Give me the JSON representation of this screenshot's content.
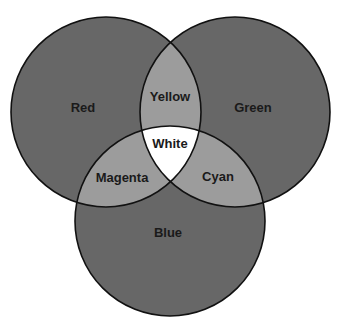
{
  "diagram": {
    "type": "venn",
    "title": "",
    "colors": {
      "primary_fill": "#676767",
      "overlap_fill": "#9c9c9c",
      "center_fill": "#ffffff",
      "stroke": "#111111",
      "background": "#ffffff"
    },
    "circles": [
      {
        "name": "red",
        "label": "Red",
        "cx": 106,
        "cy": 112,
        "r": 95
      },
      {
        "name": "green",
        "label": "Green",
        "cx": 235,
        "cy": 112,
        "r": 95
      },
      {
        "name": "blue",
        "label": "Blue",
        "cx": 170,
        "cy": 221,
        "r": 95
      }
    ],
    "labels": {
      "red": "Red",
      "green": "Green",
      "blue": "Blue",
      "yellow": "Yellow",
      "magenta": "Magenta",
      "cyan": "Cyan",
      "white": "White"
    },
    "overlaps": [
      {
        "sets": [
          "Red",
          "Green"
        ],
        "label": "Yellow"
      },
      {
        "sets": [
          "Red",
          "Blue"
        ],
        "label": "Magenta"
      },
      {
        "sets": [
          "Green",
          "Blue"
        ],
        "label": "Cyan"
      },
      {
        "sets": [
          "Red",
          "Green",
          "Blue"
        ],
        "label": "White"
      }
    ]
  }
}
